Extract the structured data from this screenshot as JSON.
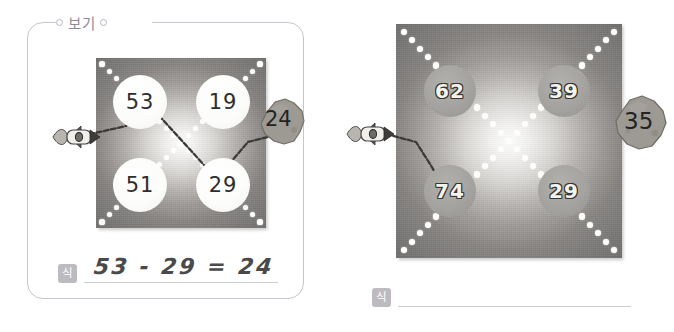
{
  "page": {
    "background_color": "#ffffff",
    "width": 674,
    "height": 332
  },
  "example_panel": {
    "tag_label": "보기",
    "tag_icon_left": "ring-icon",
    "tag_icon_right": "ring-icon",
    "border_color": "#c9c4cf",
    "board": {
      "rocket_icon": "rocket-icon",
      "dot_pattern": "x-cross-of-white-dots",
      "nodes": [
        {
          "value": "53",
          "row": 0,
          "col": 0,
          "style": "light"
        },
        {
          "value": "19",
          "row": 0,
          "col": 1,
          "style": "light"
        },
        {
          "value": "51",
          "row": 1,
          "col": 0,
          "style": "light"
        },
        {
          "value": "29",
          "row": 1,
          "col": 1,
          "style": "light"
        }
      ],
      "asteroid": {
        "value": "24",
        "icon": "asteroid-icon"
      },
      "path": "rocket -> 53 -> 29 -> 24",
      "path_drawn": true
    },
    "answer": {
      "badge_label": "식",
      "value": "53 - 29 = 24",
      "placeholder": "",
      "filled": true
    }
  },
  "problem_panel": {
    "board": {
      "rocket_icon": "rocket-icon",
      "dot_pattern": "x-cross-of-white-dots",
      "nodes": [
        {
          "value": "62",
          "row": 0,
          "col": 0,
          "style": "gray"
        },
        {
          "value": "39",
          "row": 0,
          "col": 1,
          "style": "gray"
        },
        {
          "value": "74",
          "row": 1,
          "col": 0,
          "style": "gray"
        },
        {
          "value": "29",
          "row": 1,
          "col": 1,
          "style": "gray"
        }
      ],
      "asteroid": {
        "value": "35",
        "icon": "asteroid-icon"
      },
      "path": "rocket -> 74",
      "path_drawn": true
    },
    "answer": {
      "badge_label": "식",
      "value": "",
      "placeholder": "",
      "filled": false
    }
  },
  "colors": {
    "board_light": "#fefefe",
    "board_dark": "#8a8784",
    "dot": "#fdfdfb",
    "node_gray": "#a5a39f",
    "badge": "#bdbac0",
    "line": "#cfcbd3",
    "handwriting": "#4a4a4a",
    "asteroid": "#9d9a94"
  }
}
